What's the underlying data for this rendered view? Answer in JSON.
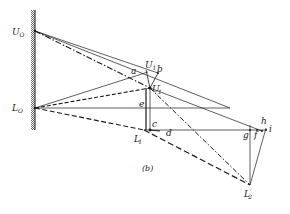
{
  "figure": {
    "caption": "(b)",
    "labels": {
      "U0": "U",
      "U0_sub": "O",
      "L0": "L",
      "L0_sub": "O",
      "U1": "U",
      "U1_sub": "1",
      "U1p": "U",
      "U1p_sub": "1",
      "U1p_prime": "′",
      "L1p": "L",
      "L1p_sub": "1",
      "L1p_prime": "′",
      "L2p": "L",
      "L2p_sub": "2",
      "L2p_prime": "′",
      "a": "a",
      "b": "b",
      "c": "c",
      "d": "d",
      "e": "e",
      "f": "f",
      "g": "g",
      "h": "h",
      "i": "i"
    }
  },
  "colors": {
    "ink": "#1a1a1a",
    "wall": "#555555"
  }
}
